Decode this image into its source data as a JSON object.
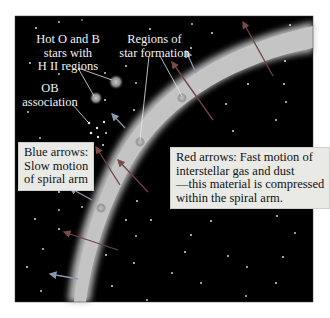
{
  "figure": {
    "background": "#000000",
    "arm_color": "#bdbdbd",
    "blue_arrow_color": "#8a97b0",
    "red_arrow_color": "#8a5a5a",
    "pointer_line_color": "#e8e8e8"
  },
  "labels": {
    "hot_ob": [
      "Hot O and B",
      "stars with",
      "H II regions"
    ],
    "star_formation": [
      "Regions of",
      "star formation"
    ],
    "ob_association": [
      "OB",
      "association"
    ]
  },
  "boxes": {
    "blue": [
      "Blue arrows:",
      "Slow motion",
      "of spiral arm"
    ],
    "red": [
      "Red arrows: Fast motion of",
      "interstellar gas and dust",
      "—this material is compressed",
      "within the spiral arm."
    ]
  }
}
